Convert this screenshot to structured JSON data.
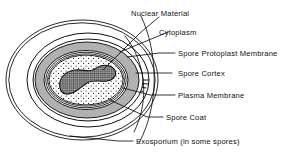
{
  "figure": {
    "background_color": "#ffffff",
    "ink_color": "#111111",
    "labels": [
      {
        "id": "nuclear-material",
        "text": "Nuclear Material"
      },
      {
        "id": "cytoplasm",
        "text": "Cytoplasm"
      },
      {
        "id": "spore-protoplast-membrane",
        "text": "Spore Protoplast Membrane"
      },
      {
        "id": "spore-cortex",
        "text": "Spore Cortex"
      },
      {
        "id": "plasma-membrane",
        "text": "Plasma Membrane"
      },
      {
        "id": "spore-coat",
        "text": "Spore Coat"
      },
      {
        "id": "exosporium",
        "text": "Exosporium (in some spores)"
      }
    ],
    "structures": [
      {
        "id": "exosporium-layer",
        "name": "Exosporium",
        "fill": "#ffffff",
        "pattern": "plain-outline"
      },
      {
        "id": "spore-coat-layer",
        "name": "Spore Coat",
        "fill": "#ffffff",
        "pattern": "radial-ticks"
      },
      {
        "id": "cortex-layer",
        "name": "Spore Cortex",
        "fill": "#b9b9b9",
        "pattern": "solid-gray"
      },
      {
        "id": "protoplast-layer",
        "name": "Spore Protoplast Membrane",
        "fill": "#ffffff",
        "pattern": "thin-line"
      },
      {
        "id": "plasma-layer",
        "name": "Plasma Membrane",
        "fill": "#ffffff",
        "pattern": "thin-line"
      },
      {
        "id": "cytoplasm-layer",
        "name": "Cytoplasm",
        "fill": "#ffffff",
        "pattern": "stipple"
      },
      {
        "id": "nuclear-body",
        "name": "Nuclear Material",
        "fill": "#3a3a3a",
        "pattern": "cross-hatch"
      }
    ]
  }
}
